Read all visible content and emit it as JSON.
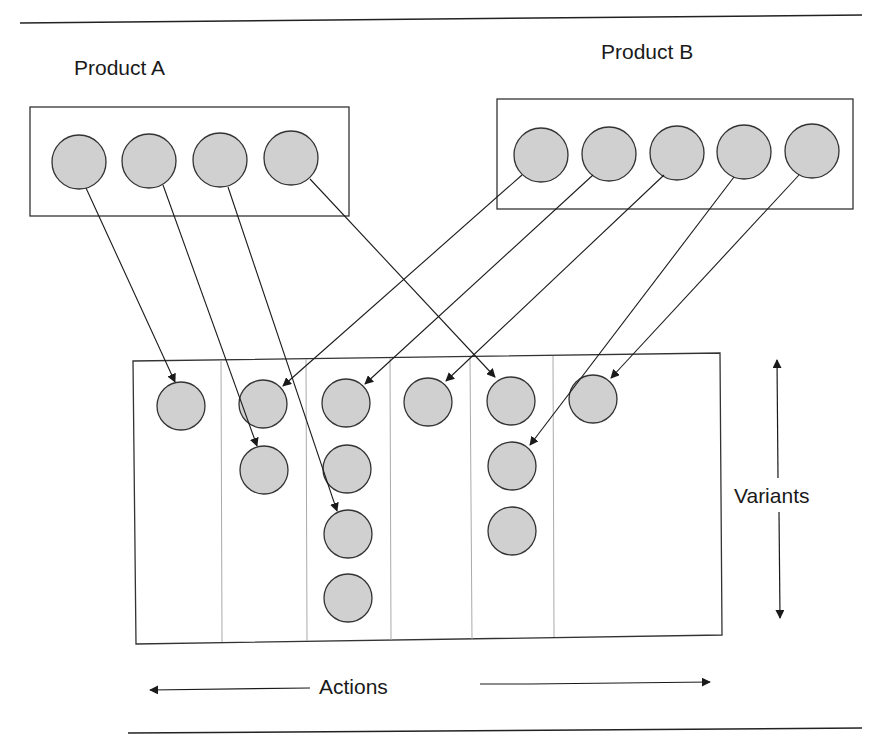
{
  "diagram": {
    "product_a": {
      "label": "Product A",
      "node_count": 4
    },
    "product_b": {
      "label": "Product B",
      "node_count": 5
    },
    "matrix": {
      "columns": 6,
      "column_node_counts": [
        1,
        2,
        4,
        1,
        3,
        1
      ]
    },
    "axes": {
      "horizontal_label": "Actions",
      "vertical_label": "Variants"
    },
    "mappings": [
      {
        "from": "A1",
        "to": "col1-row1"
      },
      {
        "from": "A2",
        "to": "col2-row2"
      },
      {
        "from": "A3",
        "to": "col3-row3"
      },
      {
        "from": "A4",
        "to": "col5-row1"
      },
      {
        "from": "B1",
        "to": "col2-row1"
      },
      {
        "from": "B2",
        "to": "col3-row1"
      },
      {
        "from": "B3",
        "to": "col4-row1"
      },
      {
        "from": "B4",
        "to": "col5-row2"
      },
      {
        "from": "B5",
        "to": "col6-row1"
      }
    ],
    "colors": {
      "node_fill": "#d0d0d0",
      "stroke": "#333333",
      "divider": "#aaaaaa"
    }
  }
}
